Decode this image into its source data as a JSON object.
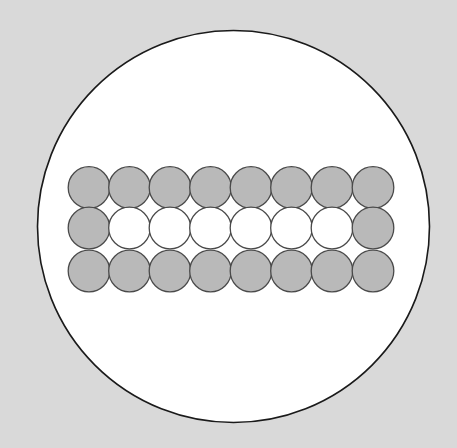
{
  "figure": {
    "background_color": "#d9d9d9",
    "outer_circle": {
      "cx": 233.5,
      "cy": 226.5,
      "r": 196,
      "fill": "#ffffff",
      "stroke": "#1a1a1a",
      "stroke_width": 1.6
    },
    "grid": {
      "rows": 3,
      "cols": 8,
      "col_centers_x": [
        89,
        129.5,
        170,
        210.5,
        251,
        291.5,
        332,
        373
      ],
      "row_centers_y": [
        187.5,
        228,
        271
      ],
      "radius": 20.8,
      "stroke": "#4a4a4a",
      "stroke_width": 1.3,
      "filled_color": "#b9b9b9",
      "empty_color": "#ffffff",
      "pattern": [
        [
          1,
          1,
          1,
          1,
          1,
          1,
          1,
          1
        ],
        [
          1,
          0,
          0,
          0,
          0,
          0,
          0,
          1
        ],
        [
          1,
          1,
          1,
          1,
          1,
          1,
          1,
          1
        ]
      ]
    },
    "counts": {
      "total_circles": 24,
      "shaded_circles": 18,
      "unshaded_circles": 6
    }
  }
}
